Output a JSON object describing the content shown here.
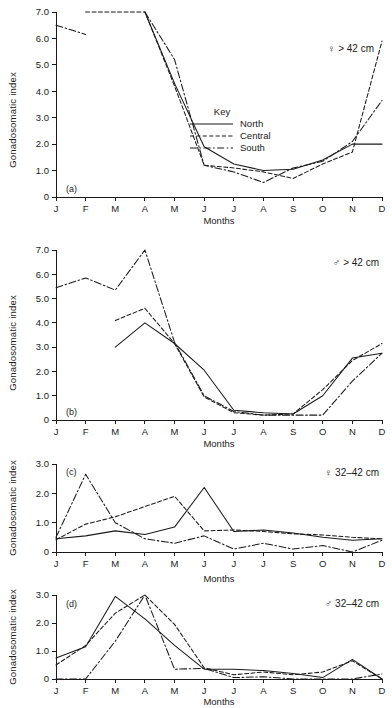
{
  "figure": {
    "y_axis_title": "Gonadosomatic index",
    "x_axis_title": "Months"
  },
  "legend": {
    "title": "Key",
    "entries": [
      {
        "label": "North",
        "style": "solid"
      },
      {
        "label": "Central",
        "style": "dashed"
      },
      {
        "label": "South",
        "style": "dash-dot"
      }
    ]
  },
  "panels": {
    "a": {
      "tag": "(a)",
      "cohort": "♀ > 42 cm"
    },
    "b": {
      "tag": "(b)",
      "cohort": "♂ > 42 cm"
    },
    "c": {
      "tag": "(c)",
      "cohort": "♀ 32–42 cm"
    },
    "d": {
      "tag": "(d)",
      "cohort": "♂ 32–42 cm"
    }
  },
  "chart_data": [
    {
      "id": "a",
      "type": "line",
      "title": "(a) ♀ > 42 cm",
      "xlabel": "Months",
      "ylabel": "Gonadosomatic index",
      "categories": [
        "J",
        "F",
        "M",
        "A",
        "M",
        "J",
        "J",
        "A",
        "S",
        "O",
        "N",
        "D"
      ],
      "yticks": [
        "0",
        "1.0",
        "2.0",
        "3.0",
        "4.0",
        "5.0",
        "6.0",
        "7.0"
      ],
      "ylim": [
        0,
        7.0
      ],
      "grid": false,
      "legend_position": "center-right",
      "series": [
        {
          "name": "North",
          "values": [
            null,
            null,
            null,
            7.0,
            4.3,
            1.9,
            1.25,
            1.0,
            1.05,
            1.4,
            2.0,
            2.0
          ]
        },
        {
          "name": "Central",
          "values": [
            null,
            7.0,
            7.0,
            7.0,
            4.2,
            1.2,
            1.1,
            0.95,
            0.7,
            1.25,
            1.7,
            5.9
          ]
        },
        {
          "name": "South",
          "values": [
            6.5,
            6.15,
            null,
            7.0,
            5.2,
            1.2,
            0.95,
            0.55,
            1.1,
            1.35,
            2.1,
            3.65
          ]
        }
      ]
    },
    {
      "id": "b",
      "type": "line",
      "title": "(b) ♂ > 42 cm",
      "xlabel": "Months",
      "ylabel": "Gonadosomatic index",
      "categories": [
        "J",
        "F",
        "M",
        "A",
        "M",
        "J",
        "J",
        "A",
        "S",
        "O",
        "N",
        "D"
      ],
      "yticks": [
        "0",
        "1.0",
        "2.0",
        "3.0",
        "4.0",
        "5.0",
        "6.0",
        "7.0"
      ],
      "ylim": [
        0,
        7.0
      ],
      "grid": false,
      "legend_position": "none",
      "series": [
        {
          "name": "North",
          "values": [
            null,
            null,
            3.0,
            4.0,
            3.15,
            2.05,
            0.4,
            0.3,
            0.25,
            1.0,
            2.55,
            2.75
          ]
        },
        {
          "name": "Central",
          "values": [
            null,
            null,
            4.1,
            4.6,
            3.15,
            0.95,
            0.3,
            0.2,
            0.25,
            1.25,
            2.45,
            3.15
          ]
        },
        {
          "name": "South",
          "values": [
            5.45,
            5.85,
            5.35,
            7.0,
            3.2,
            1.0,
            0.35,
            0.2,
            0.2,
            0.2,
            1.6,
            2.75
          ]
        }
      ]
    },
    {
      "id": "c",
      "type": "line",
      "title": "(c) ♀ 32–42 cm",
      "xlabel": "Months",
      "ylabel": "Gonadosomatic index",
      "categories": [
        "J",
        "F",
        "M",
        "A",
        "M",
        "J",
        "J",
        "J",
        "S",
        "O",
        "N",
        "D"
      ],
      "yticks": [
        "0",
        "1.0",
        "2.0",
        "3.0"
      ],
      "ylim": [
        0,
        3.0
      ],
      "grid": false,
      "legend_position": "none",
      "series": [
        {
          "name": "North",
          "values": [
            0.45,
            0.55,
            0.72,
            0.6,
            0.85,
            2.2,
            0.7,
            0.75,
            0.65,
            0.5,
            0.4,
            0.45
          ]
        },
        {
          "name": "Central",
          "values": [
            0.42,
            0.95,
            1.2,
            1.55,
            1.9,
            0.72,
            0.75,
            0.7,
            0.62,
            0.58,
            0.5,
            0.45
          ]
        },
        {
          "name": "South",
          "values": [
            0.5,
            2.65,
            1.0,
            0.45,
            0.3,
            0.55,
            0.1,
            0.3,
            0.1,
            0.22,
            0.0,
            0.4
          ]
        }
      ]
    },
    {
      "id": "d",
      "type": "line",
      "title": "(d) ♂ 32–42 cm",
      "xlabel": "Months",
      "ylabel": "Gonadosomatic index",
      "categories": [
        "J",
        "F",
        "M",
        "A",
        "M",
        "J",
        "J",
        "A",
        "S",
        "O",
        "N",
        "D"
      ],
      "yticks": [
        "0",
        "1.0",
        "2.0",
        "3.0"
      ],
      "ylim": [
        0,
        3.0
      ],
      "grid": false,
      "legend_position": "none",
      "series": [
        {
          "name": "North",
          "values": [
            0.75,
            1.15,
            2.95,
            2.15,
            1.2,
            0.35,
            0.35,
            0.3,
            0.2,
            0.05,
            0.7,
            0.0
          ]
        },
        {
          "name": "Central",
          "values": [
            0.5,
            1.2,
            2.35,
            3.0,
            1.95,
            0.4,
            0.15,
            0.25,
            0.15,
            0.25,
            0.65,
            0.0
          ]
        },
        {
          "name": "South",
          "values": [
            0.0,
            0.0,
            1.35,
            3.0,
            0.35,
            0.38,
            0.05,
            0.08,
            0.0,
            0.0,
            0.0,
            0.18
          ]
        }
      ]
    }
  ]
}
